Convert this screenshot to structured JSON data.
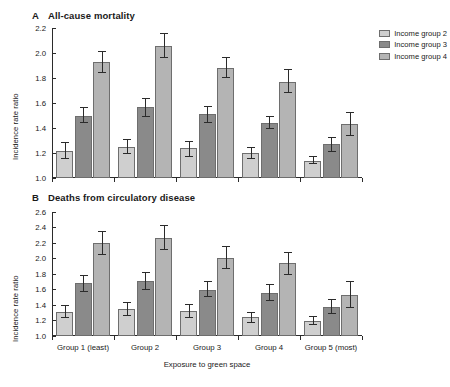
{
  "figure": {
    "xaxis_title": "Exposure to green space",
    "yaxis_title": "Incidence rate ratio"
  },
  "legend": {
    "items": [
      {
        "label": "Income group 2",
        "key": "g2",
        "color": "#cfcfcf"
      },
      {
        "label": "Income group 3",
        "key": "g3",
        "color": "#8a8a8a"
      },
      {
        "label": "Income group 4",
        "key": "g4",
        "color": "#b4b4b4"
      }
    ]
  },
  "panels": [
    {
      "letter": "A",
      "title": "All-cause mortality"
    },
    {
      "letter": "B",
      "title": "Deaths from circulatory disease"
    }
  ],
  "chart_data": [
    {
      "type": "bar",
      "panel": "A",
      "title": "All-cause mortality",
      "xlabel": "Exposure to green space",
      "ylabel": "Incidence rate ratio",
      "ylim": [
        1.0,
        2.2
      ],
      "yticks": [
        "1.0",
        "1.2",
        "1.4",
        "1.6",
        "1.8",
        "2.0",
        "2.2"
      ],
      "grid": false,
      "legend_position": "top-right",
      "categories": [
        "Group 1 (least)",
        "Group 2",
        "Group 3",
        "Group 4",
        "Group 5 (most)"
      ],
      "series": [
        {
          "name": "Income group 2",
          "values": [
            1.22,
            1.25,
            1.24,
            1.2,
            1.14
          ],
          "err_low": [
            1.15,
            1.19,
            1.17,
            1.15,
            1.11
          ],
          "err_high": [
            1.29,
            1.31,
            1.3,
            1.25,
            1.18
          ]
        },
        {
          "name": "Income group 3",
          "values": [
            1.5,
            1.57,
            1.51,
            1.44,
            1.27
          ],
          "err_low": [
            1.44,
            1.49,
            1.44,
            1.39,
            1.21
          ],
          "err_high": [
            1.57,
            1.64,
            1.58,
            1.5,
            1.33
          ]
        },
        {
          "name": "Income group 4",
          "values": [
            1.93,
            2.06,
            1.88,
            1.77,
            1.43
          ],
          "err_low": [
            1.84,
            1.96,
            1.8,
            1.68,
            1.34
          ],
          "err_high": [
            2.02,
            2.16,
            1.97,
            1.87,
            1.53
          ]
        }
      ]
    },
    {
      "type": "bar",
      "panel": "B",
      "title": "Deaths from circulatory disease",
      "xlabel": "Exposure to green space",
      "ylabel": "Incidence rate ratio",
      "ylim": [
        1.0,
        2.6
      ],
      "yticks": [
        "1.0",
        "1.2",
        "1.4",
        "1.6",
        "1.8",
        "2.0",
        "2.2",
        "2.4",
        "2.6"
      ],
      "grid": false,
      "legend_position": "none",
      "categories": [
        "Group 1 (least)",
        "Group 2",
        "Group 3",
        "Group 4",
        "Group 5 (most)"
      ],
      "series": [
        {
          "name": "Income group 2",
          "values": [
            1.31,
            1.35,
            1.32,
            1.24,
            1.2
          ],
          "err_low": [
            1.23,
            1.26,
            1.23,
            1.17,
            1.14
          ],
          "err_high": [
            1.4,
            1.44,
            1.41,
            1.31,
            1.26
          ]
        },
        {
          "name": "Income group 3",
          "values": [
            1.68,
            1.71,
            1.6,
            1.56,
            1.38
          ],
          "err_low": [
            1.57,
            1.6,
            1.5,
            1.45,
            1.28
          ],
          "err_high": [
            1.79,
            1.82,
            1.71,
            1.67,
            1.48
          ]
        },
        {
          "name": "Income group 4",
          "values": [
            2.2,
            2.27,
            2.01,
            1.94,
            1.53
          ],
          "err_low": [
            2.04,
            2.11,
            1.86,
            1.79,
            1.36
          ],
          "err_high": [
            2.36,
            2.43,
            2.16,
            2.09,
            1.71
          ]
        }
      ]
    }
  ]
}
